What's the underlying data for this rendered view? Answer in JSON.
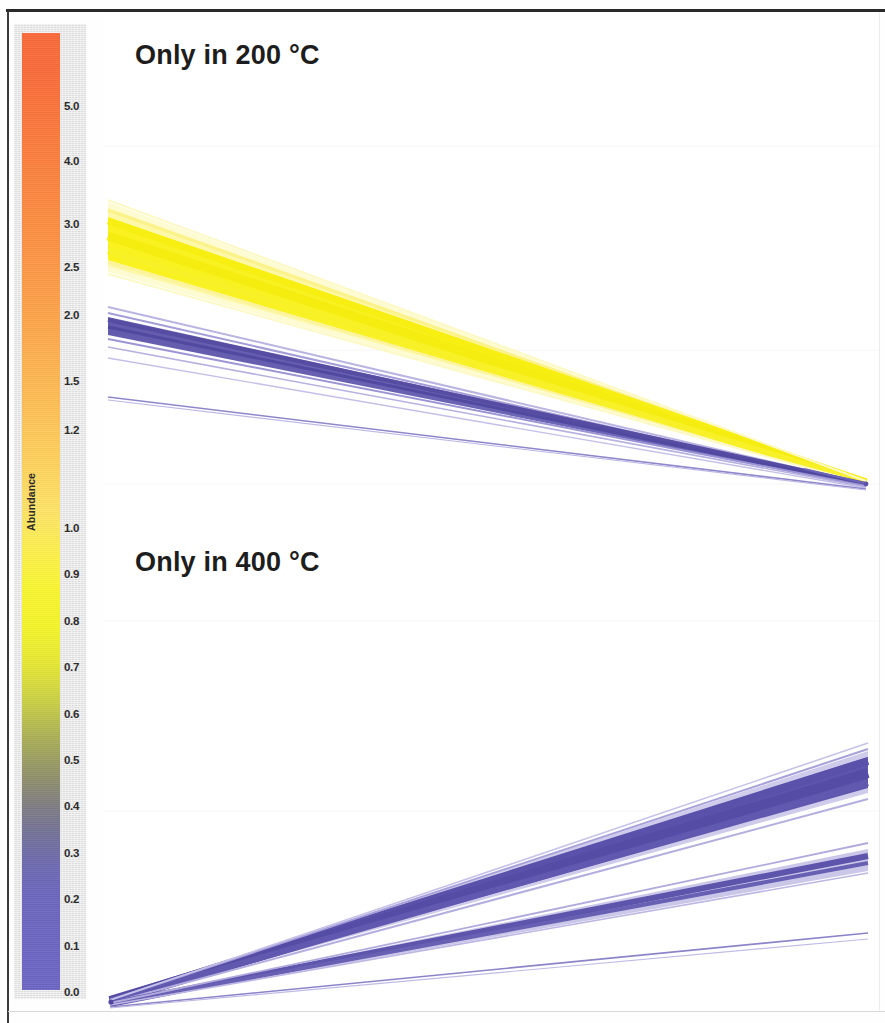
{
  "figure": {
    "width": 885,
    "height": 1023,
    "background": "#ffffff",
    "border_color": "#2a2a2a"
  },
  "legend": {
    "axis_title": "Abundance",
    "plate_color": "#e3e3e3",
    "bar_top_color": "#fa6a39",
    "bar_mid_color": "#f5f52b",
    "bar_bottom_color": "#6e66c4",
    "ticks": [
      {
        "label": "5.0",
        "value": 5.0,
        "y": 82
      },
      {
        "label": "4.0",
        "value": 4.0,
        "y": 137
      },
      {
        "label": "3.0",
        "value": 3.0,
        "y": 200
      },
      {
        "label": "2.5",
        "value": 2.5,
        "y": 243
      },
      {
        "label": "2.0",
        "value": 2.0,
        "y": 291
      },
      {
        "label": "1.5",
        "value": 1.5,
        "y": 357
      },
      {
        "label": "1.2",
        "value": 1.2,
        "y": 406
      },
      {
        "label": "1.0",
        "value": 1.0,
        "y": 504
      },
      {
        "label": "0.9",
        "value": 0.9,
        "y": 550
      },
      {
        "label": "0.8",
        "value": 0.8,
        "y": 597
      },
      {
        "label": "0.7",
        "value": 0.7,
        "y": 643
      },
      {
        "label": "0.6",
        "value": 0.6,
        "y": 690
      },
      {
        "label": "0.5",
        "value": 0.5,
        "y": 736
      },
      {
        "label": "0.4",
        "value": 0.4,
        "y": 782
      },
      {
        "label": "0.3",
        "value": 0.3,
        "y": 829
      },
      {
        "label": "0.2",
        "value": 0.2,
        "y": 875
      },
      {
        "label": "0.1",
        "value": 0.1,
        "y": 922
      },
      {
        "label": "0.0",
        "value": 0.0,
        "y": 968
      }
    ]
  },
  "panels": [
    {
      "id": "top",
      "title": "Only in 200 °C",
      "description": "Line bundles descending left-to-right, converging at the right edge"
    },
    {
      "id": "bottom",
      "title": "Only in 400 °C",
      "description": "Line bundles ascending left-to-right, fanning out from the bottom-left"
    }
  ],
  "chart_data": {
    "type": "line",
    "subtitle": "Features exclusive to each pyrolysis temperature",
    "xlabel": "",
    "ylabel": "Abundance",
    "grid": false,
    "legend_position": "left-colorbar",
    "colorbar": {
      "label": "Abundance",
      "ticks": [
        5.0,
        4.0,
        3.0,
        2.5,
        2.0,
        1.5,
        1.2,
        1.0,
        0.9,
        0.8,
        0.7,
        0.6,
        0.5,
        0.4,
        0.3,
        0.2,
        0.1,
        0.0
      ],
      "min": 0.0,
      "max": 5.0,
      "colors": [
        "#6e66c4",
        "#8f8f6d",
        "#f5f52b",
        "#feb752",
        "#fa6a39"
      ]
    },
    "panels": [
      {
        "name": "Only in 200 °C",
        "x": [
          0,
          1
        ],
        "series": [
          {
            "name": "yellow-bundle-upper",
            "values": [
              2.62,
              0.02
            ],
            "color": "#faf25a",
            "width": 5,
            "count": 14
          },
          {
            "name": "yellow-bundle-core",
            "values": [
              2.5,
              0.02
            ],
            "color": "#f7f123",
            "width": 22,
            "count": 60
          },
          {
            "name": "yellow-bundle-lower",
            "values": [
              2.36,
              0.02
            ],
            "color": "#fbf47e",
            "width": 4,
            "count": 8
          },
          {
            "name": "purple-bundle-upper",
            "values": [
              1.84,
              0.02
            ],
            "color": "#8f88cf",
            "width": 3,
            "count": 6
          },
          {
            "name": "purple-bundle-core",
            "values": [
              1.76,
              0.02
            ],
            "color": "#5b52a8",
            "width": 7,
            "count": 26
          },
          {
            "name": "purple-bundle-lower",
            "values": [
              1.66,
              0.02
            ],
            "color": "#9a94d4",
            "width": 3,
            "count": 5
          },
          {
            "name": "purple-thin-line",
            "values": [
              1.22,
              0.02
            ],
            "color": "#8880c6",
            "width": 2,
            "count": 2
          }
        ]
      },
      {
        "name": "Only in 400 °C",
        "x": [
          0,
          1
        ],
        "series": [
          {
            "name": "purple-bundle-top-upper",
            "values": [
              0.01,
              0.49
            ],
            "color": "#9992d4",
            "width": 3,
            "count": 5
          },
          {
            "name": "purple-bundle-top-core",
            "values": [
              0.01,
              0.45
            ],
            "color": "#6258b2",
            "width": 16,
            "count": 48
          },
          {
            "name": "purple-bundle-top-lower",
            "values": [
              0.01,
              0.41
            ],
            "color": "#9a93d6",
            "width": 3,
            "count": 5
          },
          {
            "name": "purple-bundle-mid-upper",
            "values": [
              0.01,
              0.31
            ],
            "color": "#9992d4",
            "width": 2,
            "count": 3
          },
          {
            "name": "purple-bundle-mid-core",
            "values": [
              0.01,
              0.28
            ],
            "color": "#6258b2",
            "width": 8,
            "count": 20
          },
          {
            "name": "purple-thin-line",
            "values": [
              0.01,
              0.17
            ],
            "color": "#8880c6",
            "width": 2,
            "count": 2
          }
        ]
      }
    ]
  }
}
